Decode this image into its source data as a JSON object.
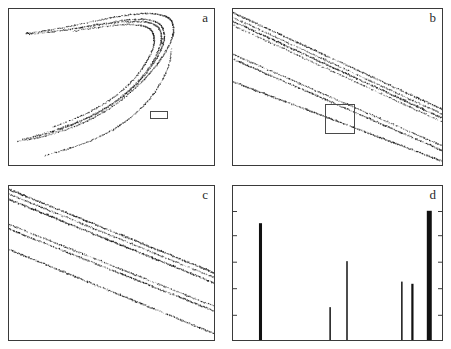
{
  "figure": {
    "background_color": "#ffffff",
    "ink_color": "#1a1a1a",
    "frame_color": "#3a3a3a"
  },
  "panels": [
    {
      "id": "a",
      "label": "a",
      "type": "attractor",
      "description": "Full strange attractor, horseshoe/C shape opening left",
      "zoom_box": {
        "x": 0.685,
        "y": 0.295,
        "width": 0.09,
        "height": 0.052
      }
    },
    {
      "id": "b",
      "label": "b",
      "type": "attractor",
      "description": "First magnification: diagonal fractal bands",
      "zoom_box": {
        "x": 0.44,
        "y": 0.2,
        "width": 0.145,
        "height": 0.19
      }
    },
    {
      "id": "c",
      "label": "c",
      "type": "attractor",
      "description": "Second magnification: finer diagonal bands",
      "zoom_box": null
    },
    {
      "id": "d",
      "label": "d",
      "type": "spectrum",
      "description": "Line spectrum of spikes"
    }
  ],
  "chart_data": [
    {
      "type": "scatter",
      "panel": "a",
      "title": "a",
      "xlabel": "",
      "ylabel": "",
      "xlim": [
        0,
        1
      ],
      "ylim": [
        0,
        1
      ],
      "grid": false,
      "legend": "none",
      "annotations": [
        "zoom-box"
      ],
      "branches": [
        {
          "name": "outer-fold",
          "points": [
            [
              0.045,
              0.155
            ],
            [
              0.13,
              0.175
            ],
            [
              0.22,
              0.205
            ],
            [
              0.32,
              0.25
            ],
            [
              0.42,
              0.31
            ],
            [
              0.52,
              0.39
            ],
            [
              0.62,
              0.5
            ],
            [
              0.7,
              0.61
            ],
            [
              0.755,
              0.71
            ],
            [
              0.79,
              0.8
            ],
            [
              0.8,
              0.87
            ],
            [
              0.785,
              0.925
            ],
            [
              0.74,
              0.955
            ],
            [
              0.66,
              0.965
            ],
            [
              0.55,
              0.95
            ],
            [
              0.43,
              0.92
            ],
            [
              0.3,
              0.885
            ],
            [
              0.18,
              0.855
            ],
            [
              0.085,
              0.838
            ]
          ]
        },
        {
          "name": "mid-band-1",
          "points": [
            [
              0.07,
              0.168
            ],
            [
              0.16,
              0.195
            ],
            [
              0.26,
              0.235
            ],
            [
              0.36,
              0.288
            ],
            [
              0.46,
              0.355
            ],
            [
              0.555,
              0.44
            ],
            [
              0.64,
              0.545
            ],
            [
              0.705,
              0.655
            ],
            [
              0.745,
              0.755
            ],
            [
              0.755,
              0.835
            ],
            [
              0.735,
              0.895
            ],
            [
              0.68,
              0.925
            ],
            [
              0.59,
              0.925
            ],
            [
              0.47,
              0.905
            ],
            [
              0.34,
              0.875
            ],
            [
              0.21,
              0.848
            ],
            [
              0.1,
              0.833
            ]
          ]
        },
        {
          "name": "mid-band-2",
          "points": [
            [
              0.12,
              0.185
            ],
            [
              0.22,
              0.225
            ],
            [
              0.33,
              0.277
            ],
            [
              0.44,
              0.345
            ],
            [
              0.545,
              0.435
            ],
            [
              0.635,
              0.545
            ],
            [
              0.7,
              0.66
            ],
            [
              0.735,
              0.76
            ],
            [
              0.74,
              0.835
            ],
            [
              0.715,
              0.888
            ],
            [
              0.655,
              0.912
            ],
            [
              0.56,
              0.912
            ],
            [
              0.44,
              0.893
            ],
            [
              0.31,
              0.866
            ],
            [
              0.19,
              0.845
            ]
          ]
        },
        {
          "name": "inner-band",
          "points": [
            [
              0.215,
              0.245
            ],
            [
              0.315,
              0.295
            ],
            [
              0.42,
              0.36
            ],
            [
              0.52,
              0.445
            ],
            [
              0.605,
              0.545
            ],
            [
              0.665,
              0.65
            ],
            [
              0.7,
              0.745
            ],
            [
              0.705,
              0.818
            ],
            [
              0.685,
              0.868
            ],
            [
              0.63,
              0.892
            ],
            [
              0.545,
              0.893
            ],
            [
              0.43,
              0.876
            ],
            [
              0.315,
              0.853
            ]
          ]
        },
        {
          "name": "lower-tail",
          "points": [
            [
              0.175,
              0.065
            ],
            [
              0.28,
              0.105
            ],
            [
              0.39,
              0.155
            ],
            [
              0.5,
              0.225
            ],
            [
              0.6,
              0.315
            ],
            [
              0.685,
              0.425
            ],
            [
              0.745,
              0.545
            ],
            [
              0.78,
              0.655
            ],
            [
              0.79,
              0.745
            ]
          ]
        }
      ]
    },
    {
      "type": "scatter",
      "panel": "b",
      "title": "b",
      "xlabel": "",
      "ylabel": "",
      "xlim": [
        0,
        1
      ],
      "ylim": [
        0,
        1
      ],
      "grid": false,
      "legend": "none",
      "annotations": [
        "zoom-box"
      ],
      "bands": [
        {
          "name": "band-top-1",
          "y0": 0.985,
          "y1": 0.345,
          "weight": 1.2
        },
        {
          "name": "band-top-2",
          "y0": 0.955,
          "y1": 0.315,
          "weight": 1.0
        },
        {
          "name": "band-top-3",
          "y0": 0.93,
          "y1": 0.29,
          "weight": 1.4
        },
        {
          "name": "band-top-4",
          "y0": 0.905,
          "y1": 0.265,
          "weight": 0.9
        },
        {
          "name": "band-mid-1",
          "y0": 0.72,
          "y1": 0.115,
          "weight": 1.0
        },
        {
          "name": "band-mid-2",
          "y0": 0.69,
          "y1": 0.085,
          "weight": 1.2
        },
        {
          "name": "band-low-1",
          "y0": 0.545,
          "y1": 0.02,
          "weight": 1.3
        }
      ]
    },
    {
      "type": "scatter",
      "panel": "c",
      "title": "c",
      "xlabel": "",
      "ylabel": "",
      "xlim": [
        0,
        1
      ],
      "ylim": [
        0,
        1
      ],
      "grid": false,
      "legend": "none",
      "bands": [
        {
          "name": "band-top-1",
          "y0": 0.985,
          "y1": 0.425,
          "weight": 1.3
        },
        {
          "name": "band-top-2",
          "y0": 0.955,
          "y1": 0.395,
          "weight": 1.0
        },
        {
          "name": "band-top-3",
          "y0": 0.92,
          "y1": 0.36,
          "weight": 1.5
        },
        {
          "name": "band-mid-1",
          "y0": 0.76,
          "y1": 0.21,
          "weight": 1.0
        },
        {
          "name": "band-mid-2",
          "y0": 0.73,
          "y1": 0.18,
          "weight": 1.2
        },
        {
          "name": "band-low-1",
          "y0": 0.6,
          "y1": 0.035,
          "weight": 1.2
        }
      ]
    },
    {
      "type": "bar",
      "panel": "d",
      "title": "d",
      "xlabel": "",
      "ylabel": "",
      "xlim": [
        0,
        1
      ],
      "ylim": [
        0,
        1
      ],
      "grid": false,
      "legend": "none",
      "bar_color": "#111111",
      "categories": [
        "f1",
        "f2",
        "f3",
        "f4",
        "f5",
        "f6"
      ],
      "x": [
        0.135,
        0.465,
        0.545,
        0.805,
        0.855,
        0.935
      ],
      "values": [
        0.8,
        0.225,
        0.54,
        0.4,
        0.385,
        0.885
      ],
      "widths": [
        0.0145,
        0.007,
        0.007,
        0.007,
        0.0105,
        0.0235
      ],
      "axis_ticks": {
        "left_y": [
          0.165,
          0.335,
          0.505,
          0.675,
          0.83
        ],
        "right_y": [
          0.165,
          0.335,
          0.505,
          0.675,
          0.83
        ],
        "bottom_x": [],
        "tick_length": 5
      }
    }
  ]
}
